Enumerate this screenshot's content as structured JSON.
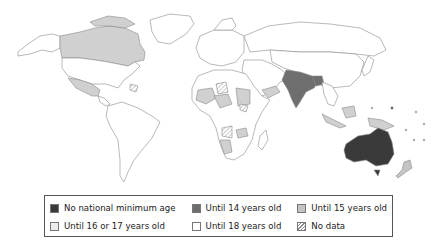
{
  "map": {
    "title": "Minimum age of criminal responsibility / legal minimum age by country",
    "colors": {
      "none": "#3a3a3a",
      "age14": "#6e6e6e",
      "age15": "#c4c4c4",
      "age16_17": "#e6e6e6",
      "age18": "#ffffff",
      "border": "#8a8a8a"
    },
    "highlighted_regions": [
      {
        "region": "Australia",
        "category": "No national minimum age"
      },
      {
        "region": "India",
        "category": "Until 14 years old"
      },
      {
        "region": "Bangladesh",
        "category": "Until 14 years old"
      },
      {
        "region": "Canada",
        "category": "Until 15 years old"
      },
      {
        "region": "Mexico",
        "category": "Until 15 years old"
      },
      {
        "region": "Parts of Africa",
        "category": "Until 15 years old / No data"
      },
      {
        "region": "Indonesia",
        "category": "Until 15 years old"
      },
      {
        "region": "Papua New Guinea",
        "category": "Until 15 years old"
      },
      {
        "region": "New Zealand",
        "category": "Until 15 years old"
      }
    ]
  },
  "legend": {
    "items": [
      {
        "label": "No national minimum age",
        "swatch": "#3a3a3a"
      },
      {
        "label": "Until 14 years old",
        "swatch": "#6e6e6e"
      },
      {
        "label": "Until 15 years old",
        "swatch": "#c4c4c4"
      },
      {
        "label": "Until 16 or 17 years old",
        "swatch": "#ececec"
      },
      {
        "label": "Until 18 years old",
        "swatch": "#ffffff"
      },
      {
        "label": "No data",
        "swatch": "hatched"
      }
    ]
  }
}
